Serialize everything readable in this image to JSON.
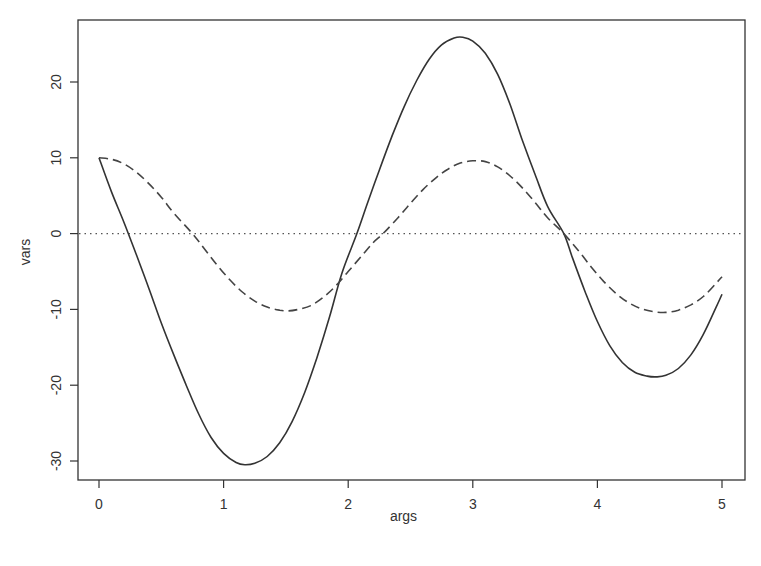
{
  "chart_data": {
    "type": "line",
    "title": "",
    "xlabel": "args",
    "ylabel": "vars",
    "xlim": [
      -0.17,
      5.17
    ],
    "ylim": [
      -32.5,
      27.5
    ],
    "x_ticks": [
      0,
      1,
      2,
      3,
      4,
      5
    ],
    "x_tick_labels": [
      "0",
      "1",
      "2",
      "3",
      "4",
      "5"
    ],
    "y_ticks": [
      -30,
      -20,
      -10,
      0,
      10,
      20
    ],
    "y_tick_labels": [
      "-30",
      "-20",
      "-10",
      "0",
      "10",
      "20"
    ],
    "grid": false,
    "legend": null,
    "reference_line": {
      "y": 0,
      "style": "dotted"
    },
    "series": [
      {
        "name": "solid",
        "style": "solid",
        "color": "#333333",
        "points": [
          [
            0.0,
            10.0
          ],
          [
            0.1,
            5.5
          ],
          [
            0.2,
            1.5
          ],
          [
            0.3,
            -2.8
          ],
          [
            0.4,
            -7.2
          ],
          [
            0.5,
            -11.8
          ],
          [
            0.6,
            -16.0
          ],
          [
            0.7,
            -20.0
          ],
          [
            0.8,
            -23.8
          ],
          [
            0.9,
            -26.9
          ],
          [
            1.0,
            -29.0
          ],
          [
            1.1,
            -30.2
          ],
          [
            1.17,
            -30.5
          ],
          [
            1.25,
            -30.3
          ],
          [
            1.35,
            -29.4
          ],
          [
            1.45,
            -27.6
          ],
          [
            1.55,
            -24.8
          ],
          [
            1.65,
            -21.0
          ],
          [
            1.75,
            -16.3
          ],
          [
            1.85,
            -11.0
          ],
          [
            1.95,
            -5.2
          ],
          [
            2.07,
            0.0
          ],
          [
            2.15,
            3.8
          ],
          [
            2.25,
            8.4
          ],
          [
            2.35,
            12.8
          ],
          [
            2.45,
            16.8
          ],
          [
            2.55,
            20.2
          ],
          [
            2.65,
            23.0
          ],
          [
            2.75,
            24.9
          ],
          [
            2.85,
            25.8
          ],
          [
            2.92,
            25.9
          ],
          [
            3.0,
            25.4
          ],
          [
            3.1,
            23.8
          ],
          [
            3.2,
            21.0
          ],
          [
            3.3,
            17.0
          ],
          [
            3.4,
            12.2
          ],
          [
            3.5,
            7.8
          ],
          [
            3.6,
            3.6
          ],
          [
            3.73,
            0.0
          ],
          [
            3.8,
            -3.2
          ],
          [
            3.9,
            -7.6
          ],
          [
            4.0,
            -11.6
          ],
          [
            4.1,
            -14.8
          ],
          [
            4.2,
            -17.0
          ],
          [
            4.3,
            -18.3
          ],
          [
            4.4,
            -18.8
          ],
          [
            4.47,
            -18.9
          ],
          [
            4.55,
            -18.7
          ],
          [
            4.65,
            -17.8
          ],
          [
            4.75,
            -16.0
          ],
          [
            4.85,
            -13.3
          ],
          [
            4.95,
            -9.8
          ],
          [
            5.0,
            -8.0
          ]
        ]
      },
      {
        "name": "dashed",
        "style": "dashed",
        "color": "#444444",
        "points": [
          [
            0.0,
            10.0
          ],
          [
            0.1,
            9.8
          ],
          [
            0.2,
            9.2
          ],
          [
            0.3,
            8.1
          ],
          [
            0.4,
            6.6
          ],
          [
            0.5,
            4.8
          ],
          [
            0.6,
            2.7
          ],
          [
            0.75,
            0.0
          ],
          [
            0.85,
            -2.1
          ],
          [
            0.95,
            -4.2
          ],
          [
            1.05,
            -6.1
          ],
          [
            1.15,
            -7.7
          ],
          [
            1.25,
            -8.9
          ],
          [
            1.35,
            -9.7
          ],
          [
            1.45,
            -10.1
          ],
          [
            1.52,
            -10.2
          ],
          [
            1.6,
            -10.0
          ],
          [
            1.7,
            -9.5
          ],
          [
            1.8,
            -8.4
          ],
          [
            1.9,
            -6.9
          ],
          [
            2.0,
            -5.0
          ],
          [
            2.1,
            -3.1
          ],
          [
            2.2,
            -1.2
          ],
          [
            2.28,
            0.0
          ],
          [
            2.4,
            2.1
          ],
          [
            2.5,
            4.0
          ],
          [
            2.6,
            5.8
          ],
          [
            2.7,
            7.3
          ],
          [
            2.8,
            8.5
          ],
          [
            2.9,
            9.3
          ],
          [
            3.0,
            9.6
          ],
          [
            3.1,
            9.5
          ],
          [
            3.2,
            8.8
          ],
          [
            3.3,
            7.6
          ],
          [
            3.4,
            6.0
          ],
          [
            3.5,
            4.1
          ],
          [
            3.6,
            2.1
          ],
          [
            3.73,
            0.0
          ],
          [
            3.85,
            -2.3
          ],
          [
            3.95,
            -4.4
          ],
          [
            4.05,
            -6.3
          ],
          [
            4.15,
            -7.9
          ],
          [
            4.25,
            -9.1
          ],
          [
            4.35,
            -9.9
          ],
          [
            4.45,
            -10.3
          ],
          [
            4.55,
            -10.4
          ],
          [
            4.65,
            -10.1
          ],
          [
            4.75,
            -9.4
          ],
          [
            4.85,
            -8.3
          ],
          [
            4.95,
            -6.6
          ],
          [
            5.0,
            -5.7
          ]
        ]
      }
    ]
  },
  "plot": {
    "box": {
      "left": 78,
      "top": 20,
      "right": 745,
      "bottom": 480
    },
    "x_px": {
      "v0": 0,
      "p0": 99,
      "v1": 5,
      "p1": 722
    },
    "y_px": {
      "v0": 20,
      "p0": 82,
      "v1": -30,
      "p1": 461
    }
  }
}
